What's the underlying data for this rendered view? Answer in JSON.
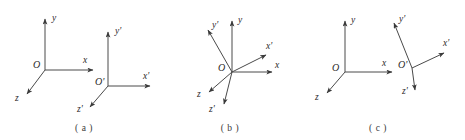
{
  "figure": {
    "background_color": "#ffffff",
    "line_color": "#4a4a4a",
    "text_color": "#2b2b2b",
    "width": 465,
    "height": 140
  },
  "panels": [
    {
      "id": "a",
      "caption": "( a )",
      "caption_x": 84,
      "caption_y": 130,
      "frames": [
        {
          "name": "unprimed",
          "origin_label": "O",
          "origin_label_x": 33,
          "origin_label_y": 68,
          "origin_x": 45,
          "origin_y": 70,
          "axes": [
            {
              "label": "y",
              "label_x": 52,
              "label_y": 20,
              "tip_x": 45,
              "tip_y": 17
            },
            {
              "label": "x",
              "label_x": 83,
              "label_y": 63,
              "tip_x": 95,
              "tip_y": 70
            },
            {
              "label": "z",
              "label_x": 16,
              "label_y": 100,
              "tip_x": 25,
              "tip_y": 96
            }
          ]
        },
        {
          "name": "primed",
          "origin_label": "O'",
          "origin_label_x": 95,
          "origin_label_y": 84,
          "origin_x": 108,
          "origin_y": 86,
          "axes": [
            {
              "label": "y'",
              "label_x": 116,
              "label_y": 33,
              "tip_x": 108,
              "tip_y": 30
            },
            {
              "label": "x'",
              "label_x": 143,
              "label_y": 79,
              "tip_x": 152,
              "tip_y": 86
            },
            {
              "label": "z'",
              "label_x": 78,
              "label_y": 110,
              "tip_x": 88,
              "tip_y": 108
            }
          ]
        }
      ]
    },
    {
      "id": "b",
      "caption": "( b )",
      "caption_x": 228,
      "caption_y": 130,
      "frames": [
        {
          "name": "unprimed",
          "origin_label": "O",
          "origin_label_x": 218,
          "origin_label_y": 70,
          "origin_x": 232,
          "origin_y": 72,
          "axes": [
            {
              "label": "y",
              "label_x": 239,
              "label_y": 22,
              "tip_x": 232,
              "tip_y": 19
            },
            {
              "label": "x",
              "label_x": 276,
              "label_y": 67,
              "tip_x": 269,
              "tip_y": 72
            },
            {
              "label": "z",
              "label_x": 198,
              "label_y": 96,
              "tip_x": 207,
              "tip_y": 93
            }
          ]
        },
        {
          "name": "primed",
          "origin_label": "",
          "origin_label_x": 0,
          "origin_label_y": 0,
          "origin_x": 232,
          "origin_y": 72,
          "axes": [
            {
              "label": "y'",
              "label_x": 214,
              "label_y": 26,
              "tip_x": 206,
              "tip_y": 28
            },
            {
              "label": "x'",
              "label_x": 266,
              "label_y": 48,
              "tip_x": 264,
              "tip_y": 56
            },
            {
              "label": "z'",
              "label_x": 211,
              "label_y": 110,
              "tip_x": 222,
              "tip_y": 106
            }
          ]
        }
      ]
    },
    {
      "id": "c",
      "caption": "( c )",
      "caption_x": 378,
      "caption_y": 130,
      "frames": [
        {
          "name": "unprimed",
          "origin_label": "O",
          "origin_label_x": 332,
          "origin_label_y": 70,
          "origin_x": 345,
          "origin_y": 72,
          "axes": [
            {
              "label": "y",
              "label_x": 352,
              "label_y": 22,
              "tip_x": 345,
              "tip_y": 19
            },
            {
              "label": "x",
              "label_x": 383,
              "label_y": 65,
              "tip_x": 394,
              "tip_y": 72
            },
            {
              "label": "z",
              "label_x": 316,
              "label_y": 99,
              "tip_x": 325,
              "tip_y": 95
            }
          ]
        },
        {
          "name": "primed",
          "origin_label": "O'",
          "origin_label_x": 399,
          "origin_label_y": 67,
          "origin_x": 412,
          "origin_y": 68,
          "axes": [
            {
              "label": "y'",
              "label_x": 400,
              "label_y": 20,
              "tip_x": 392,
              "tip_y": 21
            },
            {
              "label": "x'",
              "label_x": 444,
              "label_y": 45,
              "tip_x": 446,
              "tip_y": 54
            },
            {
              "label": "z'",
              "label_x": 404,
              "label_y": 93,
              "tip_x": 414,
              "tip_y": 92
            }
          ]
        }
      ]
    }
  ]
}
